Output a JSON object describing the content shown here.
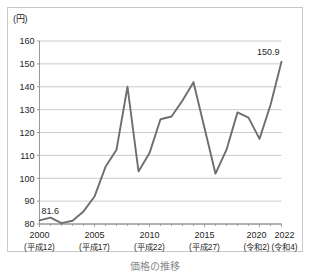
{
  "figure": {
    "unit_label": "(円)",
    "caption": "価格の推移"
  },
  "chart_data": {
    "type": "line",
    "title": "",
    "subtitle": "",
    "xlabel": "",
    "ylabel": "(円)",
    "unit": "円",
    "grid": true,
    "legend": "none",
    "xlim": [
      2000,
      2022
    ],
    "ylim": [
      80,
      160
    ],
    "ytick_labels": [
      "160",
      "150",
      "140",
      "130",
      "120",
      "110",
      "100",
      "90",
      "80"
    ],
    "ytick_values": [
      160,
      150,
      140,
      130,
      120,
      110,
      100,
      90,
      80
    ],
    "xtick_values": [
      2000,
      2005,
      2010,
      2015,
      2020,
      2022
    ],
    "xtick_labels": [
      "2000",
      "2005",
      "2010",
      "2015",
      "2020",
      "2022"
    ],
    "xtick_sublabels": [
      "(平成12)",
      "(平成17)",
      "(平成22)",
      "(平成27)",
      "(令和2)",
      "(令和4)"
    ],
    "x": [
      2000,
      2001,
      2002,
      2003,
      2004,
      2005,
      2006,
      2007,
      2008,
      2009,
      2010,
      2011,
      2012,
      2013,
      2014,
      2015,
      2016,
      2017,
      2018,
      2019,
      2020,
      2021,
      2022
    ],
    "values": [
      81.6,
      82.8,
      80.4,
      81.4,
      85.5,
      92.0,
      105.0,
      112.5,
      140.0,
      103.0,
      111.0,
      125.8,
      127.0,
      134.0,
      142.0,
      122.0,
      102.0,
      112.5,
      128.8,
      126.5,
      117.2,
      132.0,
      150.9
    ],
    "annotations": [
      {
        "label": "81.6",
        "x": 2000,
        "y": 81.6
      },
      {
        "label": "150.9",
        "x": 2022,
        "y": 150.9
      }
    ],
    "series": [
      {
        "name": "価格",
        "color": "#6e6e6e",
        "values": [
          81.6,
          82.8,
          80.4,
          81.4,
          85.5,
          92.0,
          105.0,
          112.5,
          140.0,
          103.0,
          111.0,
          125.8,
          127.0,
          134.0,
          142.0,
          122.0,
          102.0,
          112.5,
          128.8,
          126.5,
          117.2,
          132.0,
          150.9
        ]
      }
    ]
  },
  "colors": {
    "line": "#6e6e6e",
    "grid": "#b5b5b5",
    "axis": "#8f8f8f",
    "frame": "#c8c8c8",
    "text": "#262626"
  }
}
